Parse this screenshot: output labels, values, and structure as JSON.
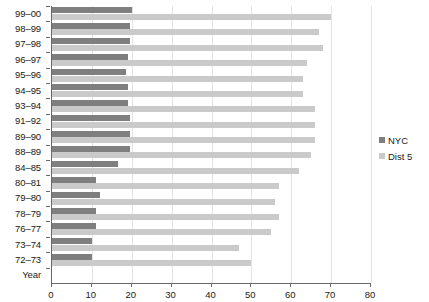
{
  "chart_data": {
    "type": "bar",
    "orientation": "horizontal",
    "title": "",
    "xlabel": "",
    "ylabel": "Year",
    "xlim": [
      0,
      80
    ],
    "xticks": [
      0,
      10,
      20,
      30,
      40,
      50,
      60,
      70,
      80
    ],
    "grid": true,
    "legend_position": "right",
    "categories": [
      "99–00",
      "98–99",
      "97–98",
      "96–97",
      "95–96",
      "94–95",
      "93–94",
      "91–92",
      "89–90",
      "88–89",
      "84–85",
      "80–81",
      "79–80",
      "78–79",
      "76–77",
      "73–74",
      "72–73"
    ],
    "axis_label_row": "Year",
    "series": [
      {
        "name": "NYC",
        "color": "#7f7f7f",
        "values": [
          20,
          19.5,
          19.5,
          19,
          18.5,
          19,
          19,
          19.5,
          19.5,
          19.5,
          16.5,
          11,
          12,
          11,
          11,
          10,
          10
        ]
      },
      {
        "name": "Dist 5",
        "color": "#cacaca",
        "values": [
          70,
          67,
          68,
          64,
          63,
          63,
          66,
          66,
          66,
          65,
          62,
          57,
          56,
          57,
          55,
          47,
          50
        ]
      }
    ]
  },
  "legend": {
    "items": [
      {
        "label": "NYC",
        "color": "#7f7f7f"
      },
      {
        "label": "Dist 5",
        "color": "#cacaca"
      }
    ]
  }
}
